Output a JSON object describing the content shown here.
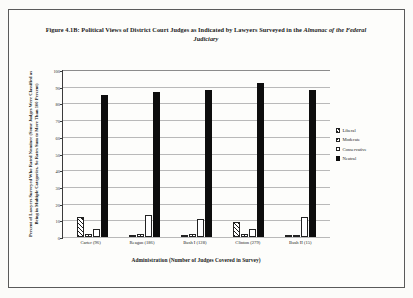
{
  "figure": {
    "title_line1": "Figure 4.1B: Political Views of District Court Judges as Indicated by Lawyers Surveyed in the",
    "title_line2": "Almanac of the Federal Judiciary"
  },
  "chart_data": {
    "type": "bar",
    "title": "Figure 4.1B: Political Views of District Court Judges as Indicated by Lawyers Surveyed in the Almanac of the Federal Judiciary",
    "xlabel": "Administration (Number of Judges Covered in Survey)",
    "ylabel": "Percent of Lawyers Surveyed Who Rated Nominee (Some Judges Were Classified as Being in Multiple Categories, So Rates Sum to More Than 100 Percent)",
    "categories": [
      "Carter (96)",
      "Reagan (186)",
      "Bush I (128)",
      "Clinton (279)",
      "Bush II (15)"
    ],
    "series": [
      {
        "name": "Liberal",
        "values": [
          12,
          1,
          1,
          9,
          1
        ]
      },
      {
        "name": "Moderate",
        "values": [
          2,
          2,
          2,
          2,
          1
        ]
      },
      {
        "name": "Conservative",
        "values": [
          5,
          13,
          11,
          5,
          12
        ]
      },
      {
        "name": "Neutral",
        "values": [
          85,
          87,
          88,
          92,
          88
        ]
      }
    ],
    "ylim": [
      0,
      100
    ],
    "yticks": [
      0,
      10,
      20,
      30,
      40,
      50,
      60,
      70,
      80,
      90,
      100
    ],
    "grid": true,
    "legend_position": "right"
  },
  "legend": {
    "items": [
      {
        "label": "Liberal",
        "style": "liberal"
      },
      {
        "label": "Moderate",
        "style": "moderate"
      },
      {
        "label": "Conservative",
        "style": "conservative"
      },
      {
        "label": "Neutral",
        "style": "neutral"
      }
    ]
  }
}
